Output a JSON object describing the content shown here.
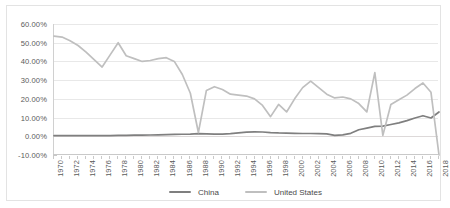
{
  "chart_data": {
    "type": "line",
    "title": "",
    "xlabel": "",
    "ylabel": "",
    "grid": true,
    "legend_position": "bottom",
    "ylim": [
      -10,
      60
    ],
    "xlim": [
      1970,
      2018
    ],
    "y_tick_labels": [
      "60.00%",
      "50.00%",
      "40.00%",
      "30.00%",
      "20.00%",
      "10.00%",
      "0.00%",
      "-10.00%"
    ],
    "y_tick_values": [
      60,
      50,
      40,
      30,
      20,
      10,
      0,
      -10
    ],
    "x_tick_labels": [
      "1970",
      "1972",
      "1974",
      "1976",
      "1978",
      "1980",
      "1982",
      "1984",
      "1986",
      "1988",
      "1990",
      "1992",
      "1994",
      "1996",
      "1998",
      "2000",
      "2002",
      "2004",
      "2006",
      "2008",
      "2010",
      "2012",
      "2014",
      "2016",
      "2018"
    ],
    "x": [
      1970,
      1971,
      1972,
      1973,
      1974,
      1975,
      1976,
      1977,
      1978,
      1979,
      1980,
      1981,
      1982,
      1983,
      1984,
      1985,
      1986,
      1987,
      1988,
      1989,
      1990,
      1991,
      1992,
      1993,
      1994,
      1995,
      1996,
      1997,
      1998,
      1999,
      2000,
      2001,
      2002,
      2003,
      2004,
      2005,
      2006,
      2007,
      2008,
      2009,
      2010,
      2011,
      2012,
      2013,
      2014,
      2015,
      2016,
      2017,
      2018
    ],
    "series": [
      {
        "name": "China",
        "color": "#7f7f7f",
        "values": [
          0.3,
          0.3,
          0.3,
          0.4,
          0.4,
          0.4,
          0.4,
          0.4,
          0.5,
          0.5,
          0.6,
          0.6,
          0.7,
          0.8,
          0.9,
          1.0,
          1.1,
          1.2,
          1.4,
          1.3,
          1.2,
          1.2,
          1.4,
          1.8,
          2.2,
          2.4,
          2.3,
          2.0,
          1.8,
          1.7,
          1.6,
          1.5,
          1.5,
          1.4,
          1.3,
          0.5,
          0.8,
          1.6,
          3.5,
          4.4,
          5.3,
          5.4,
          6.3,
          7.2,
          8.4,
          9.8,
          11.0,
          9.8,
          13.0
        ]
      },
      {
        "name": "United States",
        "color": "#bfbfbf",
        "values": [
          53.5,
          53.0,
          51.0,
          48.5,
          45.0,
          41.0,
          37.0,
          43.5,
          50.0,
          43.0,
          41.5,
          40.0,
          40.5,
          41.5,
          42.0,
          40.0,
          33.0,
          23.0,
          2.0,
          24.5,
          26.5,
          25.0,
          22.5,
          22.0,
          21.5,
          20.0,
          16.5,
          10.5,
          17.0,
          13.0,
          20.0,
          26.0,
          29.5,
          26.0,
          22.5,
          20.5,
          21.0,
          20.0,
          17.5,
          13.0,
          34.0,
          0.5,
          17.0,
          19.5,
          22.0,
          25.5,
          28.5,
          23.5,
          -10.0
        ]
      }
    ]
  },
  "legend": {
    "entries": [
      {
        "label": "China"
      },
      {
        "label": "United States"
      }
    ]
  }
}
